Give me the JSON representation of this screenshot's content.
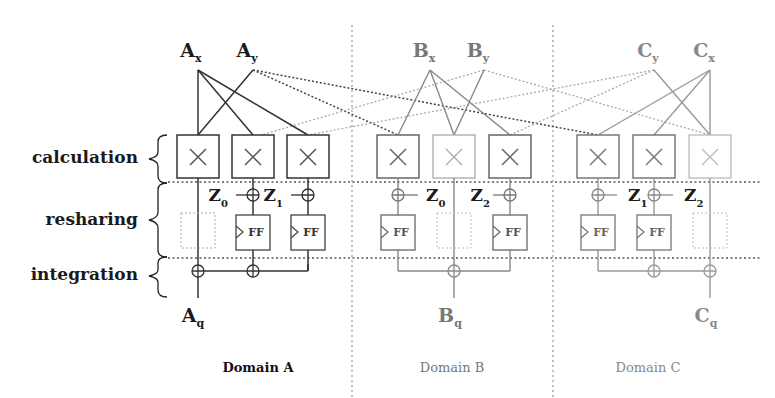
{
  "stages": [
    {
      "label": "calculation"
    },
    {
      "label": "resharing"
    },
    {
      "label": "integration"
    }
  ],
  "domains": [
    {
      "label": "Domain A",
      "color": "#222222",
      "inputs": [
        {
          "main": "A",
          "sub": "x"
        },
        {
          "main": "A",
          "sub": "y"
        }
      ],
      "output": {
        "main": "A",
        "sub": "q"
      },
      "masks": [
        {
          "main": "Z",
          "sub": "0"
        },
        {
          "main": "Z",
          "sub": "1"
        }
      ]
    },
    {
      "label": "Domain B",
      "color": "#777777",
      "inputs": [
        {
          "main": "B",
          "sub": "x"
        },
        {
          "main": "B",
          "sub": "y"
        }
      ],
      "output": {
        "main": "B",
        "sub": "q"
      },
      "masks": [
        {
          "main": "Z",
          "sub": "0"
        },
        {
          "main": "Z",
          "sub": "2"
        }
      ]
    },
    {
      "label": "Domain C",
      "color": "#888888",
      "inputs": [
        {
          "main": "C",
          "sub": "y"
        },
        {
          "main": "C",
          "sub": "x"
        }
      ],
      "output": {
        "main": "C",
        "sub": "q"
      },
      "masks": [
        {
          "main": "Z",
          "sub": "1"
        },
        {
          "main": "Z",
          "sub": "2"
        }
      ]
    }
  ],
  "symbols": {
    "multiply": "×",
    "flipflop": "FF"
  }
}
